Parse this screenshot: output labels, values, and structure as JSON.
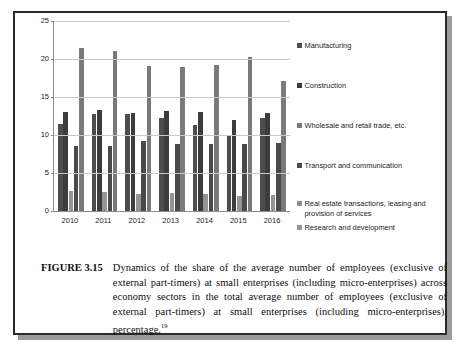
{
  "figure": {
    "label": "FIGURE 3.15",
    "caption": "Dynamics of the share of the average number of employees (exclusive of external part-timers) at small enterprises (including micro-enterprises) across economy sectors in the total average number of employees (exclusive of external part-timers) at small enterprises (including micro-enterprises), percentage.",
    "footnote_marker": "19"
  },
  "chart_data": {
    "type": "bar",
    "title": "",
    "xlabel": "",
    "ylabel": "",
    "ylim": [
      0,
      25
    ],
    "yticks": [
      0,
      5,
      10,
      15,
      20,
      25
    ],
    "grid": true,
    "legend_position": "right",
    "categories": [
      "2010",
      "2011",
      "2012",
      "2013",
      "2014",
      "2015",
      "2016"
    ],
    "series": [
      {
        "name": "Manufacturing",
        "color": "#4d4d4d",
        "values": [
          11.5,
          12.7,
          12.7,
          12.3,
          11.3,
          9.9,
          12.2
        ]
      },
      {
        "name": "Construction",
        "color": "#3c3c3c",
        "values": [
          13.0,
          13.3,
          12.9,
          13.1,
          13.0,
          12.0,
          12.9
        ]
      },
      {
        "name": "Wholesale and retail trade, etc.",
        "color": "#7a7a7a",
        "values": [
          21.4,
          21.0,
          19.1,
          19.0,
          19.2,
          20.2,
          17.1
        ]
      },
      {
        "name": "Transport and communication",
        "color": "#4a4a4a",
        "values": [
          8.6,
          8.6,
          9.2,
          8.8,
          8.8,
          8.8,
          9.0
        ]
      },
      {
        "name": "Real estate transactions, leasing and provision of services",
        "color": "#8f8f8f",
        "values": [
          0,
          0,
          0,
          0,
          0,
          0,
          0
        ]
      },
      {
        "name": "Research and development",
        "color": "#949494",
        "values": [
          2.6,
          2.5,
          2.3,
          2.4,
          2.2,
          2.0,
          2.1
        ]
      }
    ],
    "plot_order": [
      "Manufacturing",
      "Construction",
      "Research and development",
      "Transport and communication",
      "Wholesale and retail trade, etc."
    ]
  }
}
